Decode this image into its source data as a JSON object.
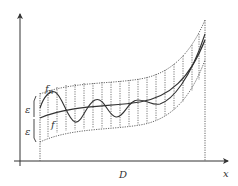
{
  "diagram": {
    "labels": {
      "fn": "f",
      "fn_sub": "n",
      "f": "f",
      "epsilon_upper": "ε",
      "epsilon_lower": "ε",
      "domain": "D",
      "x_axis": "x"
    },
    "colors": {
      "axis": "#333333",
      "curve": "#444444",
      "band": "#555555",
      "background": "#ffffff"
    }
  }
}
